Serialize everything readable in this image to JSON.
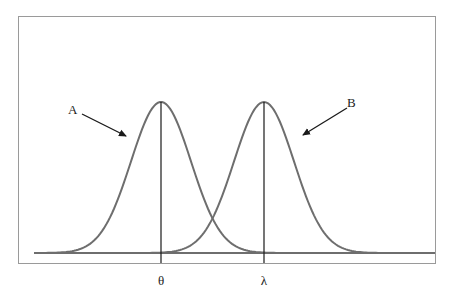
{
  "diagram": {
    "title": "",
    "curves": [
      {
        "id": "A",
        "label": "A",
        "mean_label": "θ",
        "peak_x": 161,
        "color": "#6e6e6e"
      },
      {
        "id": "B",
        "label": "B",
        "mean_label": "λ",
        "peak_x": 264,
        "color": "#6e6e6e"
      }
    ],
    "labels": {
      "curve_a": "A",
      "curve_b": "B",
      "theta": "θ",
      "lambda": "λ"
    },
    "colors": {
      "frame": "#9a9a9a",
      "curve": "#6e6e6e",
      "axis_line": "#1a1a1a",
      "arrow": "#1a1a1a"
    }
  }
}
